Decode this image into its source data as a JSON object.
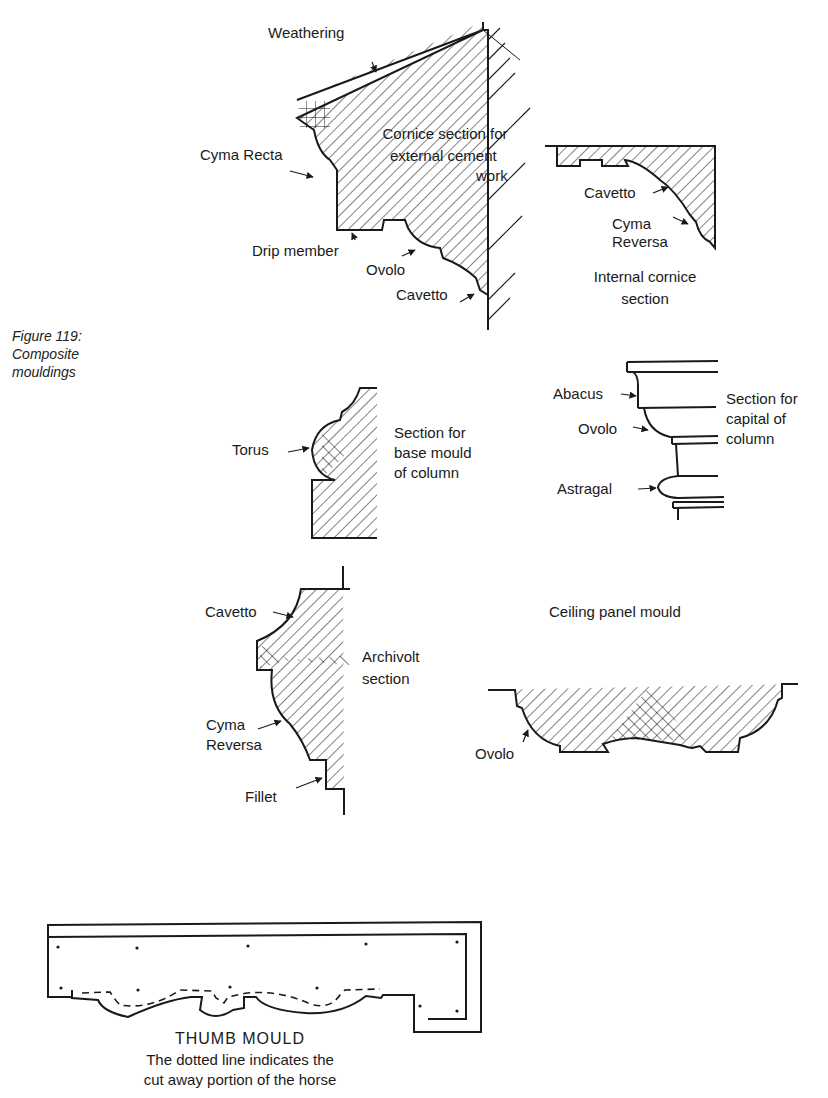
{
  "figure": {
    "number_label": "Figure 119:",
    "title_line1": "Composite",
    "title_line2": "mouldings"
  },
  "cornice_external": {
    "title_line1": "Cornice section for",
    "title_line2": "external cement",
    "title_line3": "work",
    "labels": {
      "weathering": "Weathering",
      "cyma_recta": "Cyma Recta",
      "drip_member": "Drip member",
      "ovolo": "Ovolo",
      "cavetto": "Cavetto"
    }
  },
  "cornice_internal": {
    "title_line1": "Internal cornice",
    "title_line2": "section",
    "labels": {
      "cavetto": "Cavetto",
      "cyma_line1": "Cyma",
      "cyma_line2": "Reversa"
    }
  },
  "base_mould": {
    "title_line1": "Section for",
    "title_line2": "base mould",
    "title_line3": "of column",
    "labels": {
      "torus": "Torus"
    }
  },
  "capital": {
    "title_line1": "Section for",
    "title_line2": "capital of",
    "title_line3": "column",
    "labels": {
      "abacus": "Abacus",
      "ovolo": "Ovolo",
      "astragal": "Astragal"
    }
  },
  "archivolt": {
    "title_line1": "Archivolt",
    "title_line2": "section",
    "labels": {
      "cavetto": "Cavetto",
      "cyma_line1": "Cyma",
      "cyma_line2": "Reversa",
      "fillet": "Fillet"
    }
  },
  "ceiling_panel": {
    "title": "Ceiling panel mould",
    "labels": {
      "ovolo": "Ovolo"
    }
  },
  "thumb_mould": {
    "title": "THUMB  MOULD",
    "note_line1": "The dotted line indicates the",
    "note_line2": "cut away portion of the horse"
  },
  "colors": {
    "ink": "#1a1a1a",
    "paper": "#ffffff"
  }
}
